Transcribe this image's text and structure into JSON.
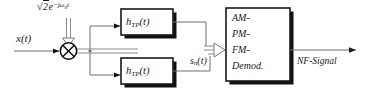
{
  "diagram": {
    "background_color": "#ffffff",
    "line_color": "#6e6e6e",
    "box_fill": "#ffffff",
    "box_border": "#1a1a1a",
    "shadow_color": "#111111",
    "text_color": "#1a1a1a"
  },
  "labels": {
    "oscillator": {
      "sqrt_radicand": "2",
      "base": "e",
      "exponent": "−jω",
      "exponent_sub": "0",
      "exponent_tail": "t",
      "full": "√2e^{-jω₀t}"
    },
    "input_signal": "x(t)",
    "filtered_signal": {
      "base": "s",
      "sub": "n",
      "tail": "(t)",
      "full": "sₙ(t)"
    },
    "output_signal": "NF-Signal"
  },
  "blocks": {
    "multiplier": {
      "name": "multiplier",
      "glyph": "⊗"
    },
    "filter_top": {
      "base": "h",
      "sub": "TP",
      "tail": "(t)",
      "full": "h_TP(t)"
    },
    "filter_bottom": {
      "base": "h",
      "sub": "TP",
      "tail": "(t)",
      "full": "h_TP(t)"
    },
    "demodulator": {
      "line1": "AM-",
      "line2": "PM-",
      "line3": "FM-",
      "line4": "Demod."
    }
  }
}
